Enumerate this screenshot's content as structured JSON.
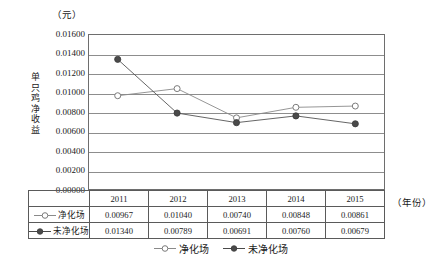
{
  "chart_data": {
    "type": "line",
    "title": "",
    "unit_label": "（元）",
    "ylabel": "单只鸡净收益",
    "xlabel": "（年份）",
    "categories": [
      "2011",
      "2012",
      "2013",
      "2014",
      "2015"
    ],
    "ylim": [
      0.0,
      0.016
    ],
    "ytick_labels": [
      "0.01600",
      "0.01400",
      "0.01200",
      "0.01000",
      "0.00800",
      "0.00600",
      "0.00400",
      "0.00200",
      "0.00000"
    ],
    "ytick_values": [
      0.016,
      0.014,
      0.012,
      0.01,
      0.008,
      0.006,
      0.004,
      0.002,
      0.0
    ],
    "grid": true,
    "legend_position": "bottom",
    "series": [
      {
        "name": "净化场",
        "marker": "open-circle",
        "color": "#8a8a8a",
        "values": [
          0.00967,
          0.0104,
          0.0074,
          0.00848,
          0.00861
        ],
        "labels": [
          "0.00967",
          "0.01040",
          "0.00740",
          "0.00848",
          "0.00861"
        ]
      },
      {
        "name": "未净化场",
        "marker": "filled-circle",
        "color": "#555555",
        "values": [
          0.0134,
          0.00789,
          0.00691,
          0.0076,
          0.00679
        ],
        "labels": [
          "0.01340",
          "0.00789",
          "0.00691",
          "0.00760",
          "0.00679"
        ]
      }
    ]
  },
  "table": {
    "corner": "",
    "header": [
      "2011",
      "2012",
      "2013",
      "2014",
      "2015"
    ],
    "rows": [
      {
        "label": "净化场",
        "marker": "open-circle",
        "cells": [
          "0.00967",
          "0.01040",
          "0.00740",
          "0.00848",
          "0.00861"
        ]
      },
      {
        "label": "未净化场",
        "marker": "filled-circle",
        "cells": [
          "0.01340",
          "0.00789",
          "0.00691",
          "0.00760",
          "0.00679"
        ]
      }
    ]
  },
  "legend": {
    "entries": [
      {
        "label": "净化场",
        "marker": "open-circle"
      },
      {
        "label": "未净化场",
        "marker": "filled-circle"
      }
    ]
  },
  "colors": {
    "series_purified": "#8a8a8a",
    "series_unpurified": "#555555",
    "grid": "#8d8d8d",
    "frame": "#6e6e6e",
    "table_border": "#5a5a5a",
    "text": "#1a1a1a"
  }
}
